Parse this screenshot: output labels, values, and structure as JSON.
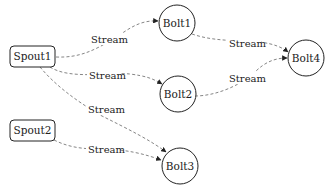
{
  "diagram": {
    "type": "directed-graph",
    "nodes": [
      {
        "id": "spout1",
        "label": "Spout1",
        "shape": "rounded-rect"
      },
      {
        "id": "spout2",
        "label": "Spout2",
        "shape": "rounded-rect"
      },
      {
        "id": "bolt1",
        "label": "Bolt1",
        "shape": "circle"
      },
      {
        "id": "bolt2",
        "label": "Bolt2",
        "shape": "circle"
      },
      {
        "id": "bolt3",
        "label": "Bolt3",
        "shape": "circle"
      },
      {
        "id": "bolt4",
        "label": "Bolt4",
        "shape": "circle"
      }
    ],
    "edges": [
      {
        "from": "spout1",
        "to": "bolt1",
        "label": "Stream"
      },
      {
        "from": "spout1",
        "to": "bolt2",
        "label": "Stream"
      },
      {
        "from": "spout1",
        "to": "bolt3",
        "label": "Stream"
      },
      {
        "from": "spout2",
        "to": "bolt3",
        "label": "Stream"
      },
      {
        "from": "bolt1",
        "to": "bolt4",
        "label": "Stream"
      },
      {
        "from": "bolt2",
        "to": "bolt4",
        "label": "Stream"
      }
    ],
    "colors": {
      "node_stroke": "#222222",
      "edge_stroke": "#777777",
      "background": "#ffffff"
    }
  }
}
